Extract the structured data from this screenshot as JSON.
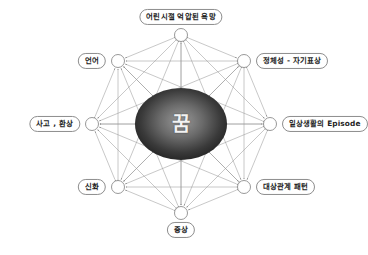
{
  "diagram": {
    "type": "radial-network",
    "background_color": "#ffffff",
    "center": {
      "label": "꿈",
      "shape": "ellipse",
      "cx": 181,
      "cy": 124,
      "rx": 46,
      "ry": 36,
      "fill_center_color": "#8f8f8f",
      "fill_edge_color": "#1f1f1f",
      "text_color": "#f2f2f2"
    },
    "edge_style": {
      "color": "#9a9a9a",
      "width": 0.55,
      "arrowheads": "both-ends",
      "connects": "all-pairs"
    },
    "node_style": {
      "radius": 6.5,
      "fill": "#ffffff",
      "stroke": "#8d8d8d",
      "stroke_width": 0.9
    },
    "label_style": {
      "border_color": "#8d8d8d",
      "text_color": "#1d1d1d",
      "background": "#ffffff"
    },
    "nodes": [
      {
        "id": "n0",
        "label": "어린시절 억압된 욕망",
        "cx": 181,
        "cy": 35,
        "label_x": 181,
        "label_y": 17,
        "label_align": "center"
      },
      {
        "id": "n1",
        "label": "정체성 - 자기표상",
        "cx": 244,
        "cy": 61,
        "label_x": 256,
        "label_y": 61,
        "label_align": "right"
      },
      {
        "id": "n2",
        "label": "일상생활의 Episode",
        "cx": 270,
        "cy": 124,
        "label_x": 282,
        "label_y": 124,
        "label_align": "right"
      },
      {
        "id": "n3",
        "label": "대상관계 패턴",
        "cx": 244,
        "cy": 187,
        "label_x": 256,
        "label_y": 187,
        "label_align": "right"
      },
      {
        "id": "n4",
        "label": "증상",
        "cx": 181,
        "cy": 213,
        "label_x": 181,
        "label_y": 230,
        "label_align": "center"
      },
      {
        "id": "n5",
        "label": "신화",
        "cx": 118,
        "cy": 187,
        "label_x": 106,
        "label_y": 187,
        "label_align": "left"
      },
      {
        "id": "n6",
        "label": "사고 , 환상",
        "cx": 92,
        "cy": 124,
        "label_x": 80,
        "label_y": 124,
        "label_align": "left"
      },
      {
        "id": "n7",
        "label": "언어",
        "cx": 118,
        "cy": 61,
        "label_x": 106,
        "label_y": 61,
        "label_align": "left"
      }
    ]
  }
}
